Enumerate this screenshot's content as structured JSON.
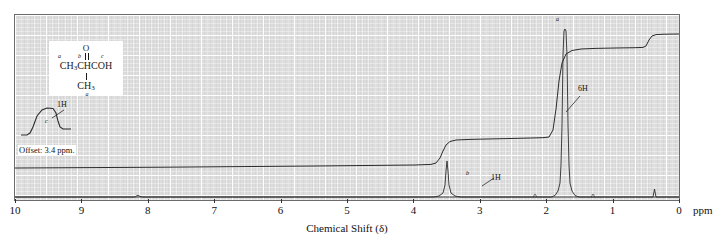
{
  "figure": {
    "kind": "nmr-spectrum",
    "axis_caption": "Chemical Shift (δ)",
    "axis_unit": "ppm",
    "offset_note": "Offset: 3.4 ppm."
  },
  "structure": {
    "carbonyl_o": "O",
    "label_a": "a",
    "label_b": "b",
    "label_c": "c",
    "main_chain_pre": "CH",
    "main_chain_sub": "3",
    "main_chain_post": "CHCOH",
    "lower_group_pre": "CH",
    "lower_group_sub": "3",
    "lower_group_label": "a"
  },
  "annotations": [
    {
      "name": "integral-label-c",
      "text": "1H",
      "x": 57,
      "y": 106
    },
    {
      "name": "peak-letter-c",
      "text": "c",
      "x": 45,
      "y": 122
    },
    {
      "name": "integral-label-a",
      "text": "6H",
      "x": 578,
      "y": 88
    },
    {
      "name": "peak-letter-a",
      "text": "a",
      "x": 556,
      "y": 18
    },
    {
      "name": "integral-label-b",
      "text": "1H",
      "x": 489,
      "y": 179
    },
    {
      "name": "peak-letter-b",
      "text": "b",
      "x": 466,
      "y": 174
    }
  ],
  "chart_data": {
    "type": "line",
    "title": "",
    "xlabel": "Chemical Shift (δ)",
    "ylabel": "",
    "xlim": [
      10,
      0
    ],
    "xticks": [
      10,
      9,
      8,
      7,
      6,
      5,
      4,
      3,
      2,
      1,
      0
    ],
    "xtick_labels": [
      "10",
      "9",
      "8",
      "7",
      "6",
      "5",
      "4",
      "3",
      "2",
      "1",
      "0"
    ],
    "grid": true,
    "legend": "none",
    "series": [
      {
        "name": "spectrum",
        "description": "1H NMR trace of 2-methylpropanoic acid (isobutyric acid)",
        "peaks": [
          {
            "label": "c",
            "shift_ppm": 12.0,
            "assignment": "COOH",
            "integration": "1H",
            "multiplicity": "singlet",
            "offset_ppm": 3.4,
            "note": "shown offset at left, 3.4 ppm offset"
          },
          {
            "label": "b",
            "shift_ppm": 2.55,
            "assignment": "CH",
            "integration": "1H",
            "multiplicity": "septet",
            "height_pct": 22
          },
          {
            "label": "a",
            "shift_ppm": 1.2,
            "assignment": "(CH3)2",
            "integration": "6H",
            "multiplicity": "doublet",
            "height_pct": 96
          },
          {
            "label": "TMS",
            "shift_ppm": 0.0,
            "assignment": "TMS reference",
            "integration": "",
            "multiplicity": "singlet",
            "height_pct": 6
          }
        ]
      },
      {
        "name": "integration-trace",
        "description": "stepped integral curve",
        "steps": [
          {
            "at_ppm": 12.0,
            "rise": "1H",
            "label": "1H"
          },
          {
            "at_ppm": 2.55,
            "rise": "1H",
            "label": "1H"
          },
          {
            "at_ppm": 1.2,
            "rise": "6H",
            "label": "6H"
          }
        ]
      }
    ]
  }
}
